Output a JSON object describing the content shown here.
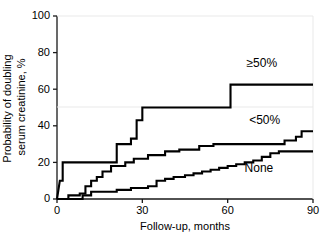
{
  "chart_data": {
    "type": "line",
    "subtype": "kaplan-meier-step",
    "title": "",
    "xlabel": "Follow-up, months",
    "ylabel": "Probability of doubling serum creatinine, %",
    "xlim": [
      0,
      90
    ],
    "ylim": [
      0,
      100
    ],
    "xticks": [
      0,
      30,
      60,
      90
    ],
    "yticks": [
      0,
      20,
      40,
      60,
      80,
      100
    ],
    "xtick_labels": [
      "0",
      "30",
      "60",
      "90"
    ],
    "ytick_labels": [
      "0",
      "20",
      "40",
      "60",
      "80",
      "100"
    ],
    "grid": false,
    "legend_position": "inline-annotations",
    "series": [
      {
        "name": "≥50%",
        "label_x": 72,
        "label_y": 72,
        "points": [
          [
            0,
            0
          ],
          [
            1,
            10
          ],
          [
            2,
            10
          ],
          [
            2,
            20
          ],
          [
            21,
            20
          ],
          [
            21,
            30
          ],
          [
            26,
            30
          ],
          [
            26,
            33
          ],
          [
            28,
            33
          ],
          [
            28,
            43
          ],
          [
            30,
            43
          ],
          [
            30,
            50
          ],
          [
            61,
            50
          ],
          [
            61,
            62.5
          ],
          [
            90,
            62.5
          ]
        ]
      },
      {
        "name": "<50%",
        "label_x": 73,
        "label_y": 41,
        "points": [
          [
            0,
            0
          ],
          [
            4,
            0
          ],
          [
            4,
            2
          ],
          [
            8,
            2
          ],
          [
            8,
            3
          ],
          [
            10,
            3
          ],
          [
            10,
            7
          ],
          [
            12,
            7
          ],
          [
            12,
            10
          ],
          [
            14,
            10
          ],
          [
            14,
            12
          ],
          [
            16,
            12
          ],
          [
            16,
            15
          ],
          [
            19,
            15
          ],
          [
            19,
            18
          ],
          [
            24,
            18
          ],
          [
            24,
            20
          ],
          [
            27,
            20
          ],
          [
            27,
            22
          ],
          [
            32,
            22
          ],
          [
            32,
            24
          ],
          [
            38,
            24
          ],
          [
            38,
            26
          ],
          [
            43,
            26
          ],
          [
            43,
            27
          ],
          [
            50,
            27
          ],
          [
            50,
            29
          ],
          [
            55,
            29
          ],
          [
            55,
            30
          ],
          [
            80,
            30
          ],
          [
            80,
            32
          ],
          [
            84,
            32
          ],
          [
            84,
            34
          ],
          [
            86,
            34
          ],
          [
            86,
            37
          ],
          [
            90,
            37
          ]
        ]
      },
      {
        "name": "None",
        "label_x": 71,
        "label_y": 15,
        "points": [
          [
            0,
            0
          ],
          [
            9,
            0
          ],
          [
            9,
            2
          ],
          [
            12,
            2
          ],
          [
            12,
            4
          ],
          [
            21,
            4
          ],
          [
            21,
            5
          ],
          [
            26,
            5
          ],
          [
            26,
            6
          ],
          [
            32,
            6
          ],
          [
            32,
            7
          ],
          [
            35,
            7
          ],
          [
            35,
            10
          ],
          [
            38,
            10
          ],
          [
            38,
            11
          ],
          [
            41,
            11
          ],
          [
            41,
            12
          ],
          [
            45,
            12
          ],
          [
            45,
            13
          ],
          [
            48,
            13
          ],
          [
            48,
            14
          ],
          [
            51,
            14
          ],
          [
            51,
            15
          ],
          [
            54,
            15
          ],
          [
            54,
            16
          ],
          [
            57,
            16
          ],
          [
            57,
            17
          ],
          [
            60,
            17
          ],
          [
            60,
            18
          ],
          [
            63,
            18
          ],
          [
            63,
            19
          ],
          [
            66,
            19
          ],
          [
            66,
            20
          ],
          [
            69,
            20
          ],
          [
            69,
            21
          ],
          [
            72,
            21
          ],
          [
            72,
            23
          ],
          [
            75,
            23
          ],
          [
            75,
            25
          ],
          [
            78,
            25
          ],
          [
            78,
            26
          ],
          [
            90,
            26
          ]
        ]
      }
    ]
  }
}
